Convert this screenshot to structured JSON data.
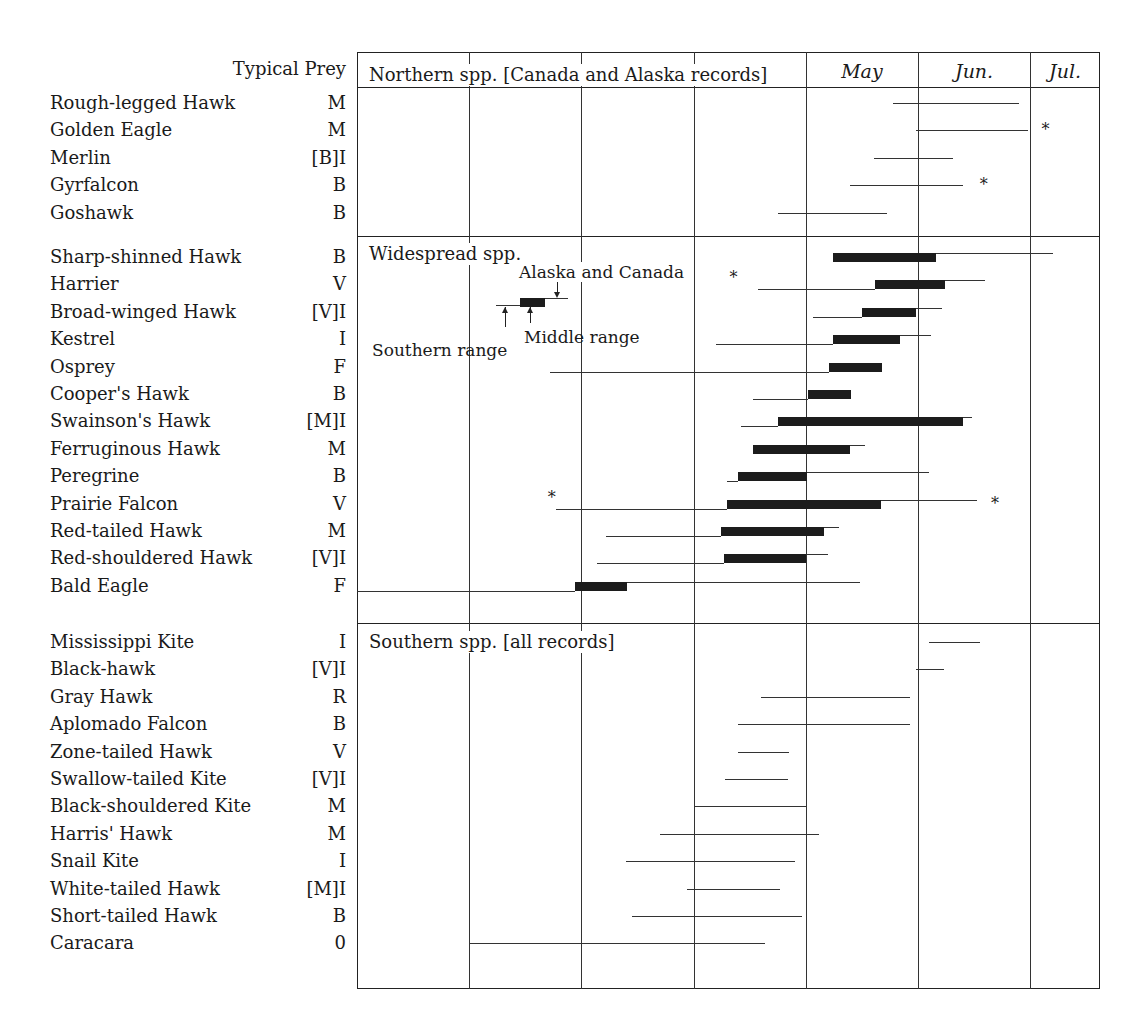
{
  "chart_data": {
    "type": "range-timeline",
    "title": "",
    "xlabel": "",
    "ylabel": "",
    "legend_header": "Typical Prey",
    "months": [
      "Jan.",
      "Feb.",
      "Mar.",
      "Apr.",
      "May",
      "Jun.",
      "Jul."
    ],
    "grid": true,
    "legend": {
      "southern": "Southern range",
      "middle": "Middle range",
      "northern": "Alaska and Canada"
    },
    "sections": [
      {
        "label": "Northern spp. [Canada and Alaska records]",
        "species": [
          {
            "name": "Rough-legged Hawk",
            "prey": "M",
            "north": [
              4.78,
              5.9
            ]
          },
          {
            "name": "Golden Eagle",
            "prey": "M",
            "north": [
              4.98,
              5.98
            ],
            "star_right": 6.1
          },
          {
            "name": "Merlin",
            "prey": "[B]I",
            "north": [
              4.61,
              5.31
            ]
          },
          {
            "name": "Gyrfalcon",
            "prey": "B",
            "north": [
              4.39,
              5.4
            ],
            "star_right": 5.55
          },
          {
            "name": "Goshawk",
            "prey": "B",
            "north": [
              3.75,
              4.72
            ]
          }
        ]
      },
      {
        "label": "Widespread spp.",
        "species": [
          {
            "name": "Sharp-shinned Hawk",
            "prey": "B",
            "middle": [
              4.24,
              5.16
            ],
            "north": [
              5.16,
              6.2
            ]
          },
          {
            "name": "Harrier",
            "prey": "V",
            "south": [
              3.57,
              4.62
            ],
            "middle": [
              4.62,
              5.24
            ],
            "north": [
              5.24,
              5.6
            ],
            "star_left": 3.32
          },
          {
            "name": "Broad-winged Hawk",
            "prey": "[V]I",
            "south": [
              4.06,
              4.5
            ],
            "middle": [
              4.5,
              4.98
            ],
            "north": [
              4.98,
              5.21
            ]
          },
          {
            "name": "Kestrel",
            "prey": "I",
            "south": [
              3.2,
              4.24
            ],
            "middle": [
              4.24,
              4.84
            ],
            "north": [
              4.84,
              5.12
            ]
          },
          {
            "name": "Osprey",
            "prey": "F",
            "south": [
              1.72,
              4.21
            ],
            "middle": [
              4.21,
              4.68
            ]
          },
          {
            "name": "Cooper's Hawk",
            "prey": "B",
            "south": [
              3.53,
              4.02
            ],
            "middle": [
              4.02,
              4.4
            ]
          },
          {
            "name": "Swainson's Hawk",
            "prey": "[M]I",
            "south": [
              3.42,
              3.75
            ],
            "middle": [
              3.75,
              5.4
            ],
            "north": [
              5.4,
              5.48
            ]
          },
          {
            "name": "Ferruginous Hawk",
            "prey": "M",
            "middle": [
              3.53,
              4.39
            ],
            "north": [
              4.39,
              4.53
            ]
          },
          {
            "name": "Peregrine",
            "prey": "B",
            "south": [
              3.3,
              3.4
            ],
            "middle": [
              3.4,
              4.01
            ],
            "north": [
              4.01,
              5.1
            ]
          },
          {
            "name": "Prairie Falcon",
            "prey": "V",
            "south": [
              1.77,
              3.3
            ],
            "middle": [
              3.3,
              4.67
            ],
            "north": [
              4.67,
              5.53
            ],
            "star_left": 1.7,
            "star_right": 5.65
          },
          {
            "name": "Red-tailed Hawk",
            "prey": "M",
            "south": [
              2.22,
              3.24
            ],
            "middle": [
              3.24,
              4.16
            ],
            "north": [
              4.16,
              4.3
            ]
          },
          {
            "name": "Red-shouldered Hawk",
            "prey": "[V]I",
            "south": [
              2.14,
              3.27
            ],
            "middle": [
              3.27,
              4.0
            ],
            "north": [
              4.0,
              4.2
            ]
          },
          {
            "name": "Bald Eagle",
            "prey": "F",
            "south": [
              0.0,
              1.94
            ],
            "middle": [
              1.94,
              2.41
            ],
            "north": [
              2.41,
              4.48
            ]
          }
        ]
      },
      {
        "label": "Southern spp. [all records]",
        "species": [
          {
            "name": "Mississippi Kite",
            "prey": "I",
            "south": [
              5.1,
              5.55
            ]
          },
          {
            "name": "Black-hawk",
            "prey": "[V]I",
            "south": [
              4.98,
              5.23
            ]
          },
          {
            "name": "Gray Hawk",
            "prey": "R",
            "south": [
              3.6,
              4.93
            ]
          },
          {
            "name": "Aplomado Falcon",
            "prey": "B",
            "south": [
              3.4,
              4.93
            ]
          },
          {
            "name": "Zone-tailed Hawk",
            "prey": "V",
            "south": [
              3.4,
              3.85
            ]
          },
          {
            "name": "Swallow-tailed Kite",
            "prey": "[V]I",
            "south": [
              3.28,
              3.84
            ]
          },
          {
            "name": "Black-shouldered Kite",
            "prey": "M",
            "south": [
              3.0,
              4.0
            ]
          },
          {
            "name": "Harris' Hawk",
            "prey": "M",
            "south": [
              2.7,
              4.12
            ]
          },
          {
            "name": "Snail Kite",
            "prey": "I",
            "south": [
              2.4,
              3.9
            ]
          },
          {
            "name": "White-tailed Hawk",
            "prey": "[M]I",
            "south": [
              2.94,
              3.77
            ]
          },
          {
            "name": "Short-tailed Hawk",
            "prey": "B",
            "south": [
              2.45,
              3.97
            ]
          },
          {
            "name": "Caracara",
            "prey": "0",
            "south": [
              1.0,
              3.64
            ]
          }
        ]
      }
    ],
    "legend_example": {
      "south": [
        1.24,
        1.45
      ],
      "middle": [
        1.45,
        1.68
      ],
      "north": [
        1.68,
        1.88
      ]
    }
  }
}
